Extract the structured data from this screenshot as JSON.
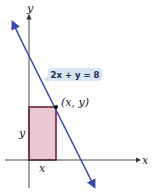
{
  "diagram": {
    "axes": {
      "x_label": "x",
      "y_label": "y"
    },
    "line": {
      "equation": "2x + y = 8",
      "color": "#3a4aa8"
    },
    "point": {
      "label": "(x, y)"
    },
    "rectangle": {
      "width_label": "x",
      "height_label": "y",
      "fill": "#e8c8d4",
      "stroke": "#7a1f3a"
    }
  }
}
